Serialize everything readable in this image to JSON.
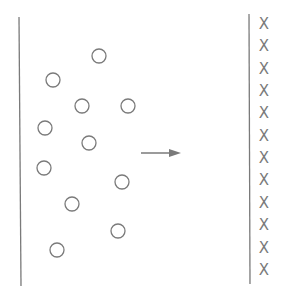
{
  "diagram": {
    "colors": {
      "stroke": "#7a7a7a",
      "background": "#ffffff"
    },
    "left_boundary": {
      "x1": 19,
      "y1": 17,
      "x2": 21,
      "y2": 286
    },
    "right_boundary": {
      "x1": 249,
      "y1": 14,
      "x2": 250,
      "y2": 284
    },
    "circles": [
      {
        "cx": 99,
        "cy": 56,
        "r": 7
      },
      {
        "cx": 53,
        "cy": 80,
        "r": 7
      },
      {
        "cx": 82,
        "cy": 106,
        "r": 7
      },
      {
        "cx": 128,
        "cy": 106,
        "r": 7
      },
      {
        "cx": 45,
        "cy": 128,
        "r": 7
      },
      {
        "cx": 89,
        "cy": 143,
        "r": 7
      },
      {
        "cx": 44,
        "cy": 168,
        "r": 7
      },
      {
        "cx": 122,
        "cy": 182,
        "r": 7
      },
      {
        "cx": 72,
        "cy": 204,
        "r": 7
      },
      {
        "cx": 118,
        "cy": 231,
        "r": 7
      },
      {
        "cx": 57,
        "cy": 250,
        "r": 7
      }
    ],
    "arrow": {
      "x1": 141,
      "y1": 153,
      "x2": 181,
      "y2": 153,
      "direction": "right"
    },
    "x_marks": {
      "glyph": "X",
      "x": 264,
      "y_positions": [
        24,
        46,
        69,
        91,
        113,
        136,
        158,
        180,
        203,
        225,
        248,
        270
      ]
    }
  }
}
